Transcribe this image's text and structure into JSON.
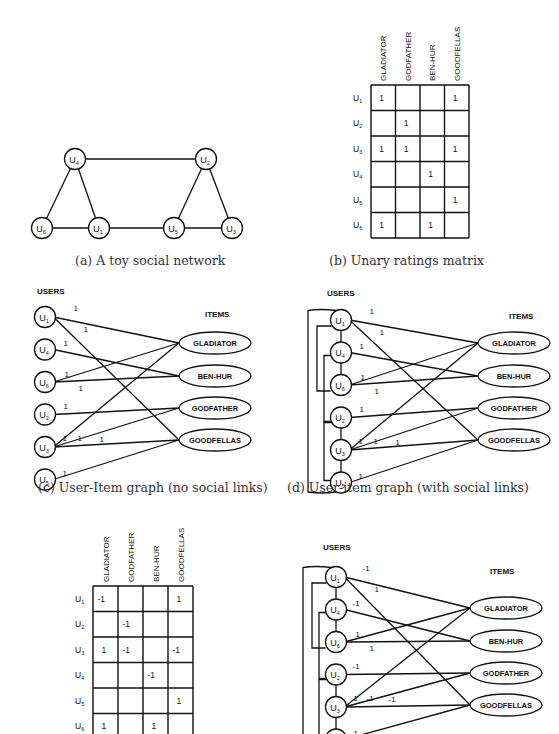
{
  "captions": {
    "a": "(a) A toy social network",
    "b": "(b) Unary ratings matrix",
    "c": "(c) User-Item graph (no social links)",
    "d": "(d) User-item graph (with social links)"
  },
  "labels": {
    "users": "USERS",
    "items": "ITEMS"
  },
  "social_network": {
    "nodes": [
      {
        "id": "U4",
        "base": "U",
        "sub": "4",
        "x": 75,
        "y": 159
      },
      {
        "id": "U2",
        "base": "U",
        "sub": "2",
        "x": 206,
        "y": 159
      },
      {
        "id": "U6",
        "base": "U",
        "sub": "6",
        "x": 42,
        "y": 228
      },
      {
        "id": "U1",
        "base": "U",
        "sub": "1",
        "x": 99,
        "y": 228
      },
      {
        "id": "U5",
        "base": "U",
        "sub": "5",
        "x": 174,
        "y": 228
      },
      {
        "id": "U3",
        "base": "U",
        "sub": "3",
        "x": 232,
        "y": 228
      }
    ],
    "edges": [
      [
        "U4",
        "U2"
      ],
      [
        "U4",
        "U6"
      ],
      [
        "U4",
        "U1"
      ],
      [
        "U6",
        "U1"
      ],
      [
        "U1",
        "U5"
      ],
      [
        "U5",
        "U3"
      ],
      [
        "U2",
        "U5"
      ],
      [
        "U2",
        "U3"
      ]
    ]
  },
  "unary_matrix": {
    "columns": [
      "GLADIATOR",
      "GODFATHER",
      "BEN-HUR",
      "GOODFELLAS"
    ],
    "rows": [
      {
        "user": "U",
        "sub": "1",
        "cells": [
          "1",
          "",
          "",
          "1"
        ]
      },
      {
        "user": "U",
        "sub": "2",
        "cells": [
          "",
          "1",
          "",
          ""
        ]
      },
      {
        "user": "U",
        "sub": "3",
        "cells": [
          "1",
          "1",
          "",
          "1"
        ]
      },
      {
        "user": "U",
        "sub": "4",
        "cells": [
          "",
          "",
          "1",
          ""
        ]
      },
      {
        "user": "U",
        "sub": "5",
        "cells": [
          "",
          "",
          "",
          "1"
        ]
      },
      {
        "user": "U",
        "sub": "6",
        "cells": [
          "1",
          "",
          "1",
          ""
        ]
      }
    ]
  },
  "signed_matrix": {
    "columns": [
      "GLADIATOR",
      "GODFATHER",
      "BEN-HUR",
      "GOODFELLAS"
    ],
    "rows": [
      {
        "user": "U",
        "sub": "1",
        "cells": [
          "-1",
          "",
          "",
          "1"
        ]
      },
      {
        "user": "U",
        "sub": "2",
        "cells": [
          "",
          "-1",
          "",
          ""
        ]
      },
      {
        "user": "U",
        "sub": "3",
        "cells": [
          "1",
          "-1",
          "",
          "-1"
        ]
      },
      {
        "user": "U",
        "sub": "4",
        "cells": [
          "",
          "",
          "-1",
          ""
        ]
      },
      {
        "user": "U",
        "sub": "5",
        "cells": [
          "",
          "",
          "",
          "1"
        ]
      },
      {
        "user": "U",
        "sub": "6",
        "cells": [
          "1",
          "",
          "1",
          ""
        ]
      }
    ]
  },
  "bipartite": {
    "users": [
      {
        "id": "U1",
        "base": "U",
        "sub": "1"
      },
      {
        "id": "U4",
        "base": "U",
        "sub": "4"
      },
      {
        "id": "U6",
        "base": "U",
        "sub": "6"
      },
      {
        "id": "U2",
        "base": "U",
        "sub": "2"
      },
      {
        "id": "U3",
        "base": "U",
        "sub": "3"
      },
      {
        "id": "U5",
        "base": "U",
        "sub": "5"
      }
    ],
    "items": [
      "GLADIATOR",
      "BEN-HUR",
      "GODFATHER",
      "GOODFELLAS"
    ],
    "edges_unary": [
      {
        "u": 0,
        "i": 0,
        "w": "1",
        "lx": 22,
        "ly": -6
      },
      {
        "u": 0,
        "i": 3,
        "w": "1",
        "lx": 32,
        "ly": 15
      },
      {
        "u": 1,
        "i": 1,
        "w": "1",
        "lx": 12,
        "ly": -4
      },
      {
        "u": 2,
        "i": 0,
        "w": "1",
        "lx": 13,
        "ly": -5
      },
      {
        "u": 2,
        "i": 1,
        "w": "1",
        "lx": 27,
        "ly": 9
      },
      {
        "u": 3,
        "i": 2,
        "w": "1",
        "lx": 12,
        "ly": -6
      },
      {
        "u": 4,
        "i": 0,
        "w": "1",
        "lx": 11,
        "ly": -6
      },
      {
        "u": 4,
        "i": 2,
        "w": "1",
        "lx": 26,
        "ly": -6
      },
      {
        "u": 4,
        "i": 3,
        "w": "1",
        "lx": 48,
        "ly": -5
      },
      {
        "u": 5,
        "i": 3,
        "w": "1",
        "lx": 11,
        "ly": -4
      }
    ],
    "edges_signed": [
      {
        "u": 0,
        "i": 0,
        "w": "-1",
        "lx": 20,
        "ly": -6
      },
      {
        "u": 0,
        "i": 3,
        "w": "1",
        "lx": 32,
        "ly": 15
      },
      {
        "u": 1,
        "i": 1,
        "w": "-1",
        "lx": 10,
        "ly": -4
      },
      {
        "u": 2,
        "i": 0,
        "w": "1",
        "lx": 13,
        "ly": -5
      },
      {
        "u": 2,
        "i": 1,
        "w": "1",
        "lx": 27,
        "ly": 9
      },
      {
        "u": 3,
        "i": 2,
        "w": "-1",
        "lx": 10,
        "ly": -6
      },
      {
        "u": 4,
        "i": 0,
        "w": "1",
        "lx": 11,
        "ly": -6
      },
      {
        "u": 4,
        "i": 2,
        "w": "-1",
        "lx": 24,
        "ly": -6
      },
      {
        "u": 4,
        "i": 3,
        "w": "-1",
        "lx": 46,
        "ly": -5
      },
      {
        "u": 5,
        "i": 3,
        "w": "1",
        "lx": 11,
        "ly": -4
      }
    ],
    "social_links": [
      [
        0,
        1
      ],
      [
        1,
        2
      ],
      [
        2,
        0
      ],
      [
        3,
        4
      ],
      [
        4,
        5
      ],
      [
        3,
        1
      ],
      [
        5,
        0
      ]
    ]
  }
}
